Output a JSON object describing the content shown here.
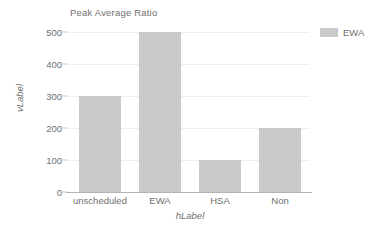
{
  "chart_data": {
    "type": "bar",
    "title": "Peak Average Ratio",
    "xlabel": "hLabel",
    "ylabel": "vLabel",
    "categories": [
      "unscheduled",
      "EWA",
      "HSA",
      "Non"
    ],
    "values": [
      300,
      500,
      100,
      200
    ],
    "series": [
      {
        "name": "EWA",
        "values": [
          300,
          500,
          100,
          200
        ],
        "color": "#c9c9c9"
      }
    ],
    "ylim": [
      0,
      500
    ],
    "yticks": [
      500,
      400,
      300,
      200,
      100,
      0
    ],
    "ytick_labels": [
      "500",
      "400",
      "300",
      "200",
      "100",
      "0"
    ],
    "grid": true,
    "legend_position": "top-right",
    "legend": [
      {
        "label": "EWA",
        "swatch": "legend-swatch-ewa",
        "color": "#c9c9c9"
      }
    ],
    "colors": {
      "bar": "#c9c9c9",
      "text": "#6f6f6f",
      "gridline": "#ededed",
      "axis": "#b4b4b4",
      "background": "#ffffff"
    }
  }
}
